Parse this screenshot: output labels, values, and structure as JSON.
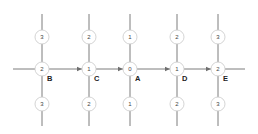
{
  "diagram": {
    "title": "",
    "columns_x": [
      42,
      89,
      130,
      177,
      218
    ],
    "rows_y": {
      "top": 37,
      "middle": 69,
      "bottom": 104
    },
    "vertical_line": {
      "y1": 14,
      "y2": 126
    },
    "horizontal_line": {
      "x1": 13,
      "x2": 245,
      "y": 69
    },
    "node_radius": 7,
    "top_row": [
      "3",
      "2",
      "1",
      "2",
      "3"
    ],
    "middle_row": [
      "2",
      "1",
      "0",
      "1",
      "2"
    ],
    "bottom_row": [
      "3",
      "2",
      "1",
      "2",
      "3"
    ],
    "middle_labels": [
      "B",
      "C",
      "A",
      "D",
      "E"
    ],
    "arrows": [
      {
        "from": "B",
        "to": "C"
      },
      {
        "from": "C",
        "to": "A"
      },
      {
        "from": "A",
        "to": "D"
      },
      {
        "from": "D",
        "to": "E"
      }
    ],
    "colors": {
      "line": "#6e6e6e",
      "node_border": "#c9c9c9",
      "text": "#444444",
      "label": "#222222"
    }
  }
}
